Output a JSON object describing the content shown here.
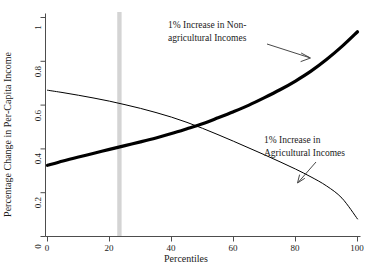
{
  "chart_data": {
    "type": "line",
    "title": "",
    "xlabel": "Percentiles",
    "ylabel": "Percentage Change in Per-Capita Income",
    "xlim": [
      0,
      100
    ],
    "ylim": [
      0,
      1
    ],
    "xticks": [
      0,
      20,
      40,
      60,
      80,
      100
    ],
    "xtick_labels": [
      "0",
      "20",
      "40",
      "60",
      "80",
      "100"
    ],
    "yticks": [
      0,
      0.2,
      0.4,
      0.6,
      0.8,
      1
    ],
    "ytick_labels": [
      "0",
      "0.2",
      "0.4",
      "0.6",
      "0.8",
      "1"
    ],
    "grid": false,
    "legend": "none (inline annotations)",
    "x": [
      0,
      5,
      10,
      15,
      20,
      25,
      30,
      35,
      40,
      45,
      50,
      55,
      60,
      65,
      70,
      75,
      80,
      85,
      90,
      95,
      100
    ],
    "series": [
      {
        "name": "1% Increase in Non-agricultural Incomes",
        "style": "thick-black-line",
        "color": "#000000",
        "linewidth": 3.2,
        "values": [
          0.325,
          0.345,
          0.363,
          0.38,
          0.398,
          0.415,
          0.432,
          0.45,
          0.47,
          0.492,
          0.515,
          0.542,
          0.57,
          0.6,
          0.634,
          0.67,
          0.71,
          0.755,
          0.808,
          0.868,
          0.935
        ]
      },
      {
        "name": "1% Increase in Agricultural Incomes",
        "style": "thin-black-line",
        "color": "#000000",
        "linewidth": 1,
        "values": [
          0.668,
          0.657,
          0.645,
          0.632,
          0.618,
          0.602,
          0.585,
          0.566,
          0.545,
          0.521,
          0.494,
          0.465,
          0.435,
          0.404,
          0.373,
          0.341,
          0.308,
          0.272,
          0.231,
          0.175,
          0.08
        ]
      }
    ],
    "vertical_band": {
      "name": "poverty-line-band",
      "x": 23.2,
      "width_percentiles": 1.4,
      "color": "#d4d4d4"
    },
    "crossing_point": {
      "x": 45,
      "y": 0.503
    }
  },
  "annotations": [
    {
      "name": "annotation-nonag",
      "lines": [
        "1% Increase in Non-",
        "agricultural Incomes"
      ],
      "line1": "1% Increase in Non-",
      "line2": "agricultural Incomes",
      "arrow_from": [
        267,
        44
      ],
      "arrow_to": [
        311,
        58
      ]
    },
    {
      "name": "annotation-ag",
      "lines": [
        "1% Increase in",
        "Agricultural Incomes"
      ],
      "line1": "1% Increase in",
      "line2": "Agricultural Incomes",
      "arrow_from": [
        316,
        162
      ],
      "arrow_to": [
        297,
        183
      ]
    }
  ],
  "axes": {
    "x_title": "Percentiles",
    "y_title": "Percentage Change in Per-Capita Income",
    "axis_color": "#4d4d4d"
  }
}
